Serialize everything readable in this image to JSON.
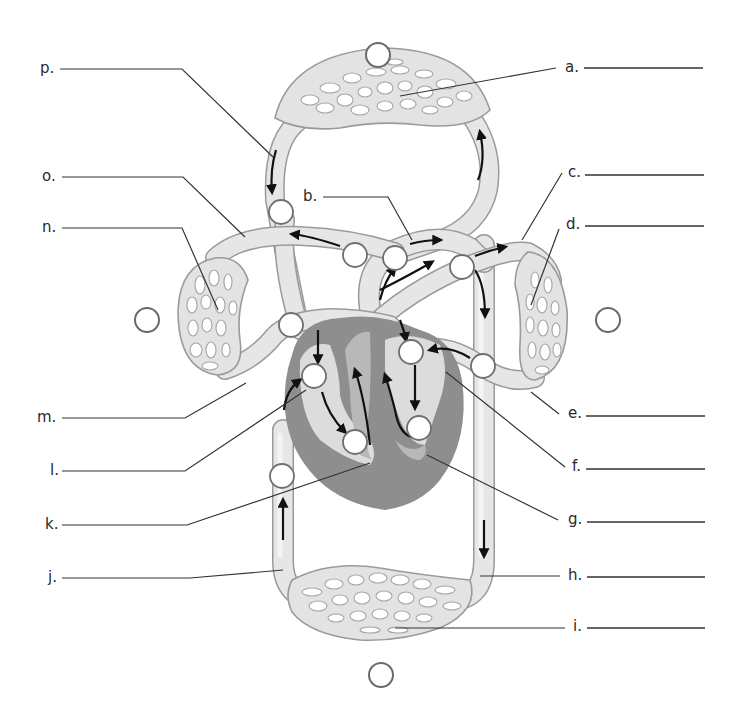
{
  "diagram": {
    "labels": [
      {
        "id": "a",
        "text": "a.",
        "answer": "",
        "side": "right"
      },
      {
        "id": "b",
        "text": "b.",
        "answer": "",
        "side": "center"
      },
      {
        "id": "c",
        "text": "c.",
        "answer": "",
        "side": "right"
      },
      {
        "id": "d",
        "text": "d.",
        "answer": "",
        "side": "right"
      },
      {
        "id": "e",
        "text": "e.",
        "answer": "",
        "side": "right"
      },
      {
        "id": "f",
        "text": "f.",
        "answer": "",
        "side": "right"
      },
      {
        "id": "g",
        "text": "g.",
        "answer": "",
        "side": "right"
      },
      {
        "id": "h",
        "text": "h.",
        "answer": "",
        "side": "right"
      },
      {
        "id": "i",
        "text": "i.",
        "answer": "",
        "side": "right"
      },
      {
        "id": "j",
        "text": "j.",
        "answer": "",
        "side": "left"
      },
      {
        "id": "k",
        "text": "k.",
        "answer": "",
        "side": "left"
      },
      {
        "id": "l",
        "text": "l.",
        "answer": "",
        "side": "left"
      },
      {
        "id": "m",
        "text": "m.",
        "answer": "",
        "side": "left"
      },
      {
        "id": "n",
        "text": "n.",
        "answer": "",
        "side": "left"
      },
      {
        "id": "o",
        "text": "o.",
        "answer": "",
        "side": "left"
      },
      {
        "id": "p",
        "text": "p.",
        "answer": "",
        "side": "left"
      }
    ],
    "region_circles": [
      {
        "id": "top",
        "position": "above upper capillary bed (upper body)",
        "value": ""
      },
      {
        "id": "left",
        "position": "left of right lung",
        "value": ""
      },
      {
        "id": "right",
        "position": "right of left lung",
        "value": ""
      },
      {
        "id": "bottom",
        "position": "below lower capillary bed (lower body)",
        "value": ""
      }
    ],
    "vessel_circle_count": 16,
    "colors": {
      "vessel_fill": "#e6e6e6",
      "vessel_outline": "#9a9a9a",
      "heart_muscle": "#8e8e8e",
      "heart_chamber": "#dcdcdc",
      "arrow": "#111111",
      "text": "#2a2a2a"
    }
  }
}
